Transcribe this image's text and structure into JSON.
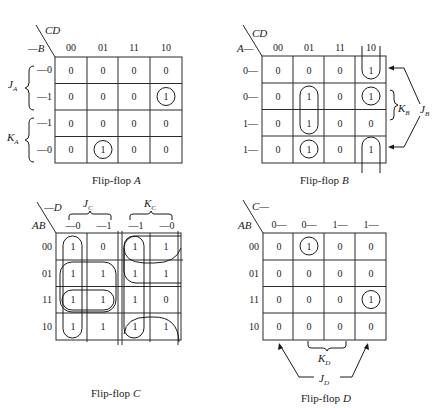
{
  "maps": {
    "A": {
      "caption": "Flip-flop A",
      "caption_prefix": "Flip-flop ",
      "caption_var": "A",
      "col_var": "CD",
      "row_var": "—B",
      "col_headers": [
        "00",
        "01",
        "11",
        "10"
      ],
      "row_headers": [
        "—0",
        "—1",
        "—1",
        "—0"
      ],
      "cells": [
        [
          "0",
          "0",
          "0",
          "0"
        ],
        [
          "0",
          "0",
          "0",
          "1"
        ],
        [
          "0",
          "0",
          "0",
          "0"
        ],
        [
          "0",
          "1",
          "0",
          "0"
        ]
      ],
      "groups": [
        {
          "label": "J",
          "sub": "A",
          "rows": "0-1"
        },
        {
          "label": "K",
          "sub": "A",
          "rows": "2-3"
        }
      ]
    },
    "B": {
      "caption_prefix": "Flip-flop ",
      "caption_var": "B",
      "col_var": "CD",
      "row_var": "A—",
      "col_headers": [
        "00",
        "01",
        "11",
        "10"
      ],
      "row_headers": [
        "0—",
        "0—",
        "1—",
        "1—"
      ],
      "cells": [
        [
          "0",
          "0",
          "0",
          "1"
        ],
        [
          "0",
          "1",
          "0",
          "1"
        ],
        [
          "0",
          "1",
          "0",
          "0"
        ],
        [
          "0",
          "1",
          "0",
          "1"
        ]
      ],
      "groups": [
        {
          "label": "K",
          "sub": "B"
        },
        {
          "label": "J",
          "sub": "B"
        }
      ]
    },
    "C": {
      "caption_prefix": "Flip-flop ",
      "caption_var": "C",
      "col_var": "—D",
      "row_var": "AB",
      "col_headers": [
        "—0",
        "—1",
        "—1",
        "—0"
      ],
      "row_headers": [
        "00",
        "01",
        "11",
        "10"
      ],
      "cells": [
        [
          "1",
          "0",
          "1",
          "1"
        ],
        [
          "1",
          "1",
          "1",
          "1"
        ],
        [
          "1",
          "1",
          "1",
          "0"
        ],
        [
          "1",
          "1",
          "1",
          "1"
        ]
      ],
      "groups": [
        {
          "label": "J",
          "sub": "C"
        },
        {
          "label": "K",
          "sub": "C"
        }
      ]
    },
    "D": {
      "caption_prefix": "Flip-flop ",
      "caption_var": "D",
      "col_var": "C—",
      "row_var": "AB",
      "col_headers": [
        "0—",
        "0—",
        "1—",
        "1—"
      ],
      "row_headers": [
        "00",
        "01",
        "11",
        "10"
      ],
      "cells": [
        [
          "0",
          "1",
          "0",
          "0"
        ],
        [
          "0",
          "0",
          "0",
          "0"
        ],
        [
          "0",
          "0",
          "0",
          "1"
        ],
        [
          "0",
          "0",
          "0",
          "0"
        ]
      ],
      "groups": [
        {
          "label": "K",
          "sub": "D"
        },
        {
          "label": "J",
          "sub": "D"
        }
      ]
    }
  }
}
